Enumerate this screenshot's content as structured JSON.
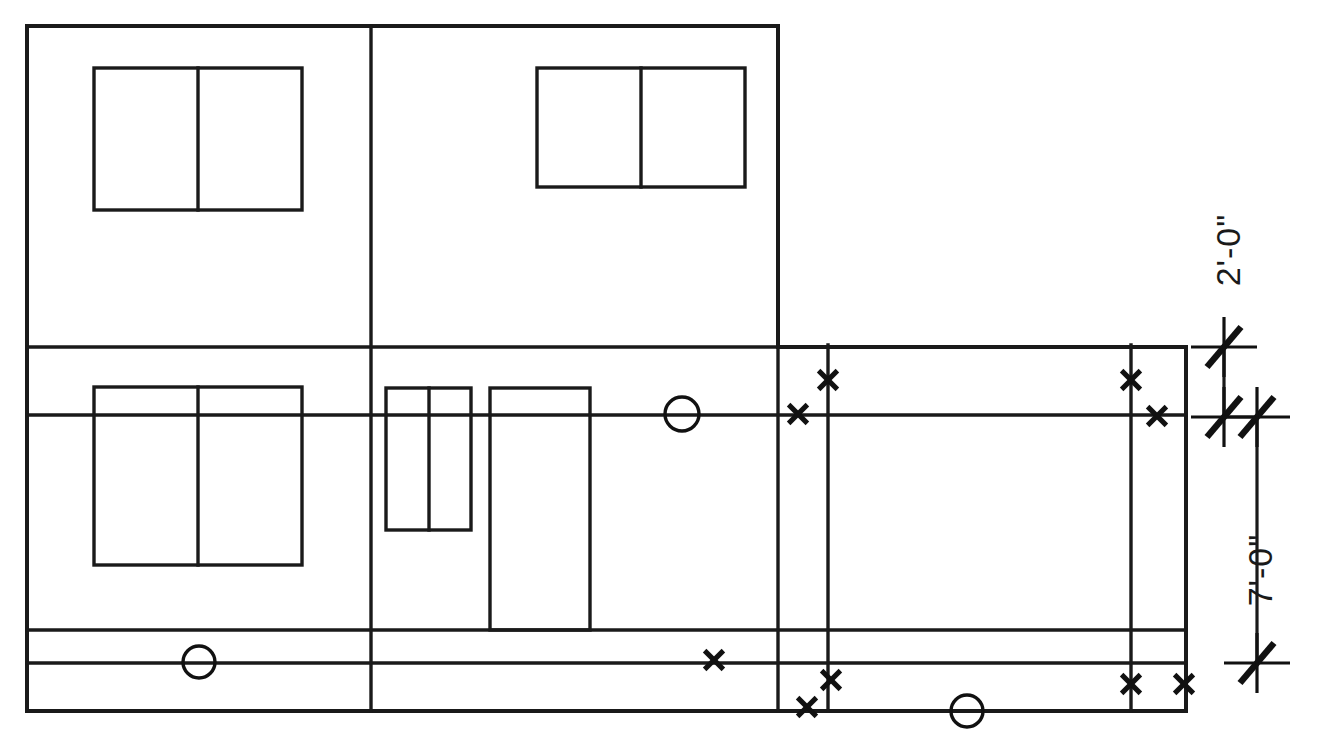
{
  "drawing": {
    "title": "Building Elevation / Framing Plan",
    "type": "architectural-line-drawing",
    "canvas": {
      "width": 1318,
      "height": 749
    },
    "colors": {
      "line": "#1a1a1a",
      "background": "#ffffff",
      "marker": "#111111"
    },
    "stroke": {
      "outline": 4.0,
      "interior": 3.4,
      "thin": 2.6,
      "marker": 5.0,
      "dimension": 3.2
    },
    "outline": {
      "left": 27,
      "top": 26,
      "right": 1186,
      "bottom": 711,
      "upper_block_right": 778,
      "upper_block_bottom": 347
    },
    "horizontal_lines": [
      {
        "name": "upper-block-base",
        "y": 347,
        "x1": 27,
        "x2": 1186
      },
      {
        "name": "mid-reference-line",
        "y": 415,
        "x1": 27,
        "x2": 1186
      },
      {
        "name": "lower-band-top",
        "y": 630,
        "x1": 27,
        "x2": 1186
      },
      {
        "name": "lower-band-bottom",
        "y": 663,
        "x1": 27,
        "x2": 1186
      },
      {
        "name": "base-line",
        "y": 711,
        "x1": 27,
        "x2": 1186
      }
    ],
    "vertical_lines": [
      {
        "name": "left-bay-divider",
        "x": 371,
        "y1": 26,
        "y2": 711
      },
      {
        "name": "upper-block-right-edge",
        "x": 778,
        "y1": 26,
        "y2": 711
      },
      {
        "name": "right-bay-left-post",
        "x": 828,
        "y1": 345,
        "y2": 711
      },
      {
        "name": "right-bay-right-post",
        "x": 1131,
        "y1": 345,
        "y2": 711
      }
    ],
    "windows": [
      {
        "name": "window-upper-left",
        "x": 94,
        "y": 68,
        "width": 208,
        "height": 142,
        "mullion_x": 198
      },
      {
        "name": "window-upper-right",
        "x": 537,
        "y": 68,
        "width": 208,
        "height": 119,
        "mullion_x": 641
      },
      {
        "name": "window-lower-left",
        "x": 94,
        "y": 387,
        "width": 208,
        "height": 178,
        "mullion_x": 198
      }
    ],
    "panels": [
      {
        "name": "panel-narrow-double",
        "x": 386,
        "y": 388,
        "width": 85,
        "height": 142,
        "mullion_x": 429
      },
      {
        "name": "panel-tall-door",
        "x": 490,
        "y": 388,
        "width": 100,
        "height": 242,
        "mullion_x": null
      }
    ],
    "circle_markers": [
      {
        "name": "circle-marker-mid-wall",
        "cx": 682,
        "cy": 414,
        "r": 17
      },
      {
        "name": "circle-marker-lower-left",
        "cx": 199,
        "cy": 662,
        "r": 16
      },
      {
        "name": "circle-marker-base",
        "cx": 967,
        "cy": 711,
        "r": 16
      }
    ],
    "cross_markers": [
      {
        "name": "cross-marker-upper-left-post",
        "cx": 798,
        "cy": 414,
        "size": 15
      },
      {
        "name": "cross-marker-upper-left-high",
        "cx": 828,
        "cy": 380,
        "size": 15
      },
      {
        "name": "cross-marker-upper-right-high",
        "cx": 1131,
        "cy": 380,
        "size": 15
      },
      {
        "name": "cross-marker-upper-right-line",
        "cx": 1157,
        "cy": 416,
        "size": 15
      },
      {
        "name": "cross-marker-lower-mid",
        "cx": 714,
        "cy": 660,
        "size": 15
      },
      {
        "name": "cross-marker-lower-post-high",
        "cx": 831,
        "cy": 680,
        "size": 15
      },
      {
        "name": "cross-marker-lower-post-low",
        "cx": 807,
        "cy": 707,
        "size": 15
      },
      {
        "name": "cross-marker-lower-right-post",
        "cx": 1131,
        "cy": 684,
        "size": 15
      },
      {
        "name": "cross-marker-lower-right-edge",
        "cx": 1184,
        "cy": 684,
        "size": 15
      }
    ],
    "dimensions": [
      {
        "name": "dimension-2-0",
        "label": "2'-0\"",
        "orientation": "vertical",
        "line_x": 1224,
        "y_start": 347,
        "y_end": 417,
        "label_x": 1240,
        "label_y": 250,
        "rotation": -90
      },
      {
        "name": "dimension-7-0",
        "label": "7'-0\"",
        "orientation": "vertical",
        "line_x": 1257,
        "y_start": 417,
        "y_end": 663,
        "label_x": 1272,
        "label_y": 570,
        "rotation": -90
      }
    ],
    "dimension_ticks": [
      {
        "name": "tick-2-0-top",
        "x": 1224,
        "y": 347,
        "arm": 33
      },
      {
        "name": "tick-2-0-bottom",
        "x": 1224,
        "y": 417,
        "arm": 33
      },
      {
        "name": "tick-7-0-top",
        "x": 1257,
        "y": 417,
        "arm": 33
      },
      {
        "name": "tick-7-0-bottom",
        "x": 1257,
        "y": 663,
        "arm": 33
      }
    ]
  }
}
